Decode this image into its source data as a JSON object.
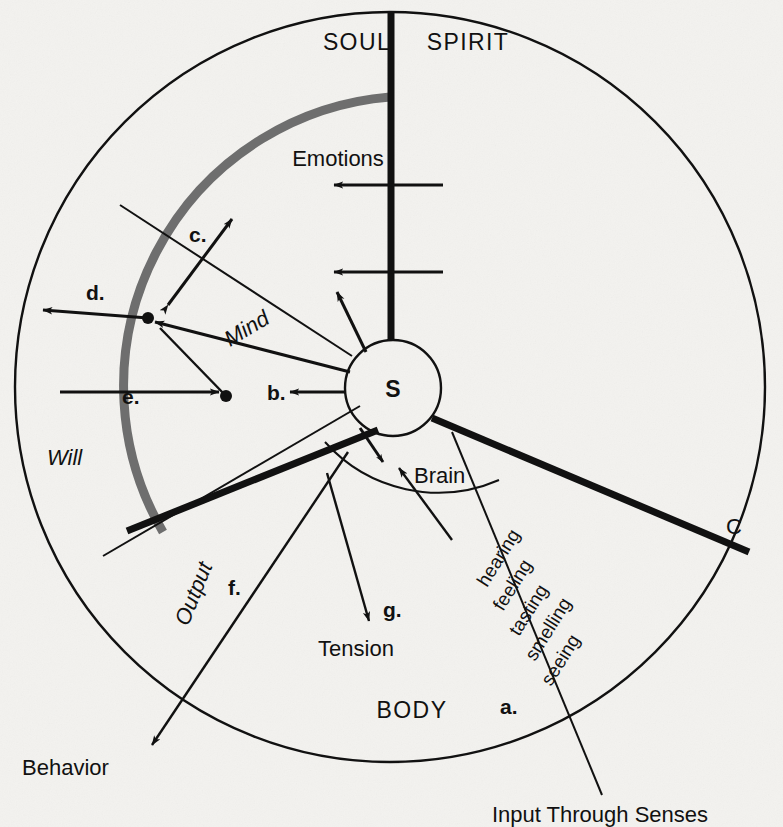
{
  "diagram": {
    "title_implicit": "Spirit / Soul / Body tripartite diagram",
    "sectors": {
      "soul": "SOUL",
      "spirit": "SPIRIT",
      "body": "BODY"
    },
    "inner_labels": {
      "emotions": "Emotions",
      "mind": "Mind",
      "will": "Will",
      "brain": "Brain",
      "tension": "Tension",
      "output": "Output",
      "behavior": "Behavior",
      "center_node": "S",
      "c_marker": "C"
    },
    "senses": [
      "hearing",
      "feeling",
      "tasting",
      "smelling",
      "seeing"
    ],
    "input_caption": "Input Through Senses",
    "keys": [
      {
        "id": "a",
        "label": "a."
      },
      {
        "id": "b",
        "label": "b."
      },
      {
        "id": "c",
        "label": "c."
      },
      {
        "id": "d",
        "label": "d."
      },
      {
        "id": "e",
        "label": "e."
      },
      {
        "id": "f",
        "label": "f."
      },
      {
        "id": "g",
        "label": "g."
      }
    ],
    "colors": {
      "ink": "#111111",
      "gray_arc": "#6e6e6e",
      "paper": "#f3f2ef"
    }
  }
}
